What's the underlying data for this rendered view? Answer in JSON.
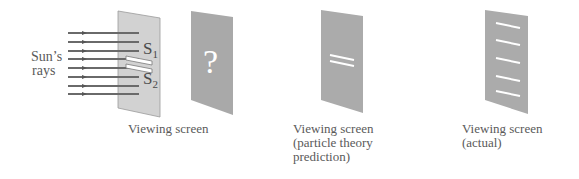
{
  "diagram": {
    "source_label": {
      "line1": "Sun’s",
      "line2": "rays"
    },
    "slits": {
      "s1": "S",
      "s1_sub": "1",
      "s2": "S",
      "s2_sub": "2"
    },
    "question_mark": "?",
    "screens": [
      {
        "id": "unknown",
        "label": [
          "Viewing screen"
        ]
      },
      {
        "id": "particle",
        "label": [
          "Viewing screen",
          "(particle theory",
          "prediction)"
        ]
      },
      {
        "id": "actual",
        "label": [
          "Viewing screen",
          "(actual)"
        ]
      }
    ],
    "ray_count": 8,
    "particle_bands": 2,
    "actual_bands": 5,
    "colors": {
      "barrier": "#cfcfcf",
      "screen": "#a8a8a8",
      "ray": "#6e6e6e",
      "band": "#ffffff",
      "text": "#5a5a5a"
    }
  }
}
